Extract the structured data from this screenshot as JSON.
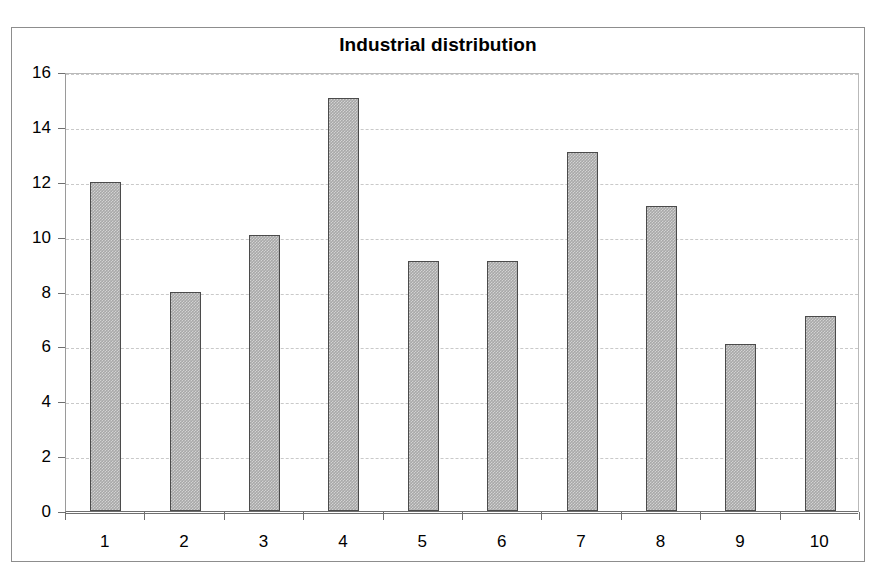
{
  "chart_data": {
    "type": "bar",
    "title": "Industrial distribution",
    "xlabel": "",
    "ylabel": "",
    "categories": [
      "1",
      "2",
      "3",
      "4",
      "5",
      "6",
      "7",
      "8",
      "9",
      "10"
    ],
    "values": [
      12,
      8,
      10.05,
      15.05,
      9.1,
      9.1,
      13.1,
      11.1,
      6.1,
      7.1
    ],
    "ylim": [
      0,
      16
    ],
    "ytick_step": 2,
    "ytick_labels": [
      "16",
      "14",
      "12",
      "10",
      "8",
      "6",
      "4",
      "2",
      "0"
    ],
    "ytick_values": [
      16,
      14,
      12,
      10,
      8,
      6,
      4,
      2,
      0
    ],
    "grid": true,
    "grid_orientation": "horizontal",
    "grid_style": "dashed",
    "legend": false,
    "legend_position": "none",
    "series": [
      {
        "name": "Industrial distribution",
        "values": [
          12,
          8,
          10.05,
          15.05,
          9.1,
          9.1,
          13.1,
          11.1,
          6.1,
          7.1
        ]
      }
    ]
  },
  "style": {
    "bar_fill": "#a8a8a8",
    "bar_border": "#4b4b4b",
    "gridline_color": "#c9c9c9",
    "axis_color": "#6f6f6f",
    "frame_color": "#8d8d8d",
    "text_color": "#000000",
    "background": "#ffffff"
  }
}
